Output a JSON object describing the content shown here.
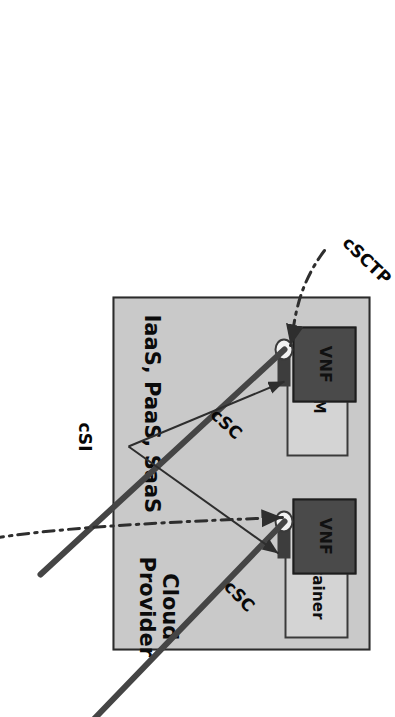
{
  "diagram": {
    "orientation_degrees": 90,
    "boundary": {
      "name": "cloud-provider-boundary",
      "fill_color": "#c9c9c9",
      "border_color": "#2b2b2b"
    },
    "zone_labels": {
      "service_models": "IaaS, PaaS, SaaS",
      "provider": "Cloud\nProvider"
    },
    "nodes": [
      {
        "id": "vm",
        "host_label": "VM",
        "vnf_label": "VNF",
        "host_fill": "#d4d4d4",
        "vnf_fill": "#4a4a4a"
      },
      {
        "id": "container",
        "host_label": "Container",
        "vnf_label": "VNF",
        "host_fill": "#d4d4d4",
        "vnf_fill": "#4a4a4a"
      }
    ],
    "edges": [
      {
        "id": "csc-vm",
        "label": "cSC",
        "style": "thick-solid",
        "target": "vm"
      },
      {
        "id": "csc-container",
        "label": "cSC",
        "style": "thick-solid",
        "target": "container"
      },
      {
        "id": "csi",
        "label": "cSI",
        "style": "thin-arrow",
        "target": "vm, container"
      },
      {
        "id": "csctp-vm",
        "label": "cSCTP",
        "style": "dash-dot-arrow",
        "target": "vm"
      },
      {
        "id": "csctp-container",
        "label": "cSCTP",
        "style": "dash-dot-arrow",
        "target": "container"
      }
    ],
    "colors": {
      "boundary_fill": "#c9c9c9",
      "boundary_stroke": "#2b2b2b",
      "host_fill": "#d4d4d4",
      "host_stroke": "#3a3a3a",
      "vnf_fill": "#4a4a4a",
      "vnf_stroke": "#1d1d1d",
      "port_fill": "#f2f2f2",
      "line_color": "#3f3f3f",
      "text_color": "#0b0b0b"
    }
  }
}
